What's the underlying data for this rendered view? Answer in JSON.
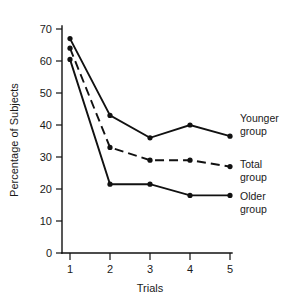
{
  "chart_data": {
    "type": "line",
    "title": "",
    "xlabel": "Trials",
    "ylabel": "Percentage of Subjects",
    "x": [
      1,
      2,
      3,
      4,
      5
    ],
    "xticklabels": [
      "1",
      "2",
      "3",
      "4",
      "5"
    ],
    "yticklabels": [
      "0",
      "10",
      "20",
      "30",
      "40",
      "50",
      "60",
      "70"
    ],
    "yticks": [
      0,
      10,
      20,
      30,
      40,
      50,
      60,
      70
    ],
    "xlim": [
      0.55,
      5.45
    ],
    "ylim": [
      0,
      72
    ],
    "grid": false,
    "legend_position": "right-inline",
    "series": [
      {
        "name": "Younger group",
        "label_line1": "Younger",
        "label_line2": "group",
        "linestyle": "solid",
        "marker": "filled-circle",
        "color": "#111111",
        "values": [
          67,
          43,
          36,
          40,
          36.5
        ]
      },
      {
        "name": "Total group",
        "label_line1": "Total",
        "label_line2": "group",
        "linestyle": "dashed",
        "marker": "filled-circle",
        "color": "#111111",
        "values": [
          64,
          33,
          29,
          29,
          27
        ]
      },
      {
        "name": "Older group",
        "label_line1": "Older",
        "label_line2": "group",
        "linestyle": "solid",
        "marker": "filled-circle",
        "color": "#111111",
        "values": [
          60.5,
          21.5,
          21.5,
          18,
          18
        ]
      }
    ]
  },
  "axes": {
    "x_title": "Trials",
    "y_title": "Percentage of Subjects"
  }
}
